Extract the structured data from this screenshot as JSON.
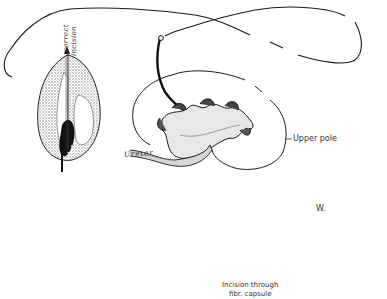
{
  "figure": {
    "labels": {
      "correct": "correct",
      "incision": "incision",
      "ureter": "Ureter",
      "upper_pole": "Upper pole",
      "initial": "W.",
      "caption_line1": "Incision through",
      "caption_line2": "fibr. capsule"
    },
    "colors": {
      "ink": "#1a1a1a",
      "shading": "#9a9a9a",
      "background": "#ffffff"
    }
  }
}
